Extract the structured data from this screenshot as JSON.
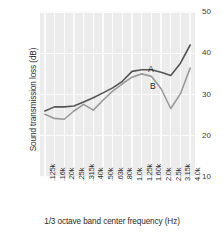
{
  "chart_data": {
    "type": "line",
    "title": "",
    "xlabel": "1/3 octave band center frequency (Hz)",
    "ylabel": "Sound transmission loss (dB)",
    "categories": [
      ".125k",
      ".16k",
      ".20k",
      ".25k",
      ".315k",
      ".40k",
      ".50k",
      ".63k",
      ".80k",
      "1.0k",
      "1.25k",
      "1.60k",
      "2.0k",
      "2.5k",
      "3.15k",
      "4.0k"
    ],
    "yticks": [
      50,
      40,
      30,
      20,
      10
    ],
    "ylim": [
      10,
      50
    ],
    "grid": "vertical-and-horizontal-white",
    "legend": "inline-annotations",
    "series": [
      {
        "name": "A",
        "color": "#555555",
        "label_x": 148,
        "label_y": 64,
        "values": [
          26.0,
          27.0,
          27.0,
          27.2,
          28.2,
          29.2,
          30.4,
          31.6,
          33.2,
          35.6,
          36.0,
          36.0,
          35.4,
          34.6,
          37.6,
          42.0
        ]
      },
      {
        "name": "B",
        "color": "#9a9a9a",
        "label_x": 150,
        "label_y": 81,
        "values": [
          25.2,
          24.2,
          24.0,
          26.0,
          27.6,
          26.2,
          28.6,
          30.8,
          32.6,
          34.2,
          35.0,
          34.4,
          31.4,
          26.6,
          30.2,
          36.4
        ]
      }
    ]
  },
  "axes": {
    "ytick_labels": [
      "50",
      "40",
      "30",
      "20",
      "10"
    ],
    "xtick_labels": [
      ".125k",
      ".16k",
      ".20k",
      ".25k",
      ".315k",
      ".40k",
      ".50k",
      ".63k",
      ".80k",
      "1.0k",
      "1.25k",
      "1.60k",
      "2.0k",
      "2.5k",
      "3.15k",
      "4.0k"
    ]
  },
  "colors": {
    "panel_background": "#ececec",
    "gridline": "#fbfbfb",
    "series_a": "#555555",
    "series_b": "#9a9a9a",
    "text": "#2b2b2b"
  }
}
